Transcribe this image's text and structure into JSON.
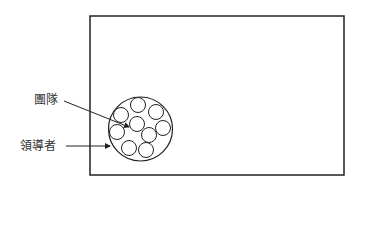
{
  "diagram": {
    "frame": {
      "x": 90,
      "y": 16,
      "width": 254,
      "height": 159,
      "stroke": "#222222"
    },
    "group_circle": {
      "cx": 140.5,
      "cy": 129,
      "r": 32,
      "stroke": "#222222"
    },
    "member_circles": [
      {
        "cx": 138,
        "cy": 105,
        "r": 7.5
      },
      {
        "cx": 156,
        "cy": 112,
        "r": 7.5
      },
      {
        "cx": 121,
        "cy": 115,
        "r": 7.5
      },
      {
        "cx": 137,
        "cy": 124,
        "r": 7.5
      },
      {
        "cx": 163,
        "cy": 128,
        "r": 7.5
      },
      {
        "cx": 117,
        "cy": 132,
        "r": 7.5
      },
      {
        "cx": 149,
        "cy": 135,
        "r": 7.5
      },
      {
        "cx": 129,
        "cy": 148,
        "r": 7.5
      },
      {
        "cx": 146,
        "cy": 150,
        "r": 7.5
      }
    ],
    "labels": {
      "team": "團隊",
      "leader": "領導者"
    },
    "arrows": {
      "team": {
        "x1": 64,
        "y1": 101,
        "x2": 129,
        "y2": 127
      },
      "leader": {
        "x1": 66,
        "y1": 146,
        "x2": 110,
        "y2": 146
      }
    }
  }
}
